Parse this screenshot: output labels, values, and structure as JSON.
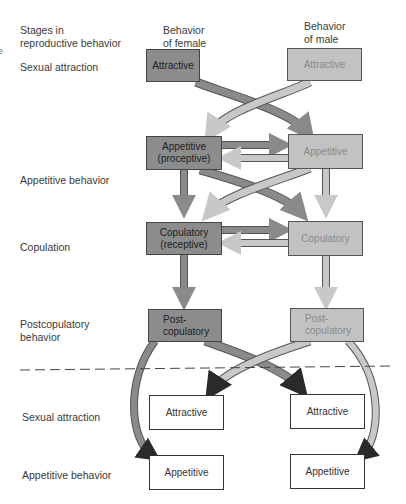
{
  "headers": {
    "stages": "Stages in\nreproductive behavior",
    "female": "Behavior\nof female",
    "male": "Behavior\nof male"
  },
  "edge_text": "e",
  "stage_labels": [
    "Sexual attraction",
    "Appetitive behavior",
    "Copulation",
    "Postcopulatory\nbehavior",
    "Sexual attraction",
    "Appetitive behavior"
  ],
  "female_boxes": [
    "Attractive",
    "Appetitive\n(proceptive)",
    "Copulatory\n(receptive)",
    "Post-\ncopulatory"
  ],
  "male_boxes": [
    "Attractive",
    "Appetitive",
    "Copulatory",
    "Post-\ncopulatory"
  ],
  "next_cycle": {
    "female": [
      "Attractive",
      "Appetitive"
    ],
    "male": [
      "Attractive",
      "Appetitive"
    ]
  },
  "colors": {
    "female_fill": "#8c8c8c",
    "male_fill": "#c2c2c2",
    "arrow_dark": "#8a8a8a",
    "arrow_light": "#c8c8c8",
    "arrowhead": "#2a2a2a"
  }
}
